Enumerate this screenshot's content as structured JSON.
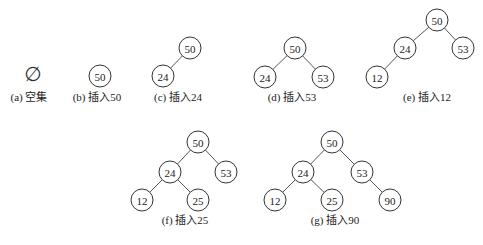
{
  "figure": {
    "node_radius": 11,
    "panels": [
      {
        "id": "a",
        "caption": "(a) 空集",
        "empty_symbol": "∅",
        "symbol_pos": [
          33,
          74
        ],
        "caption_pos": [
          29,
          101
        ],
        "nodes": [],
        "edges": []
      },
      {
        "id": "b",
        "caption": "(b) 插入50",
        "caption_pos": [
          97,
          101
        ],
        "nodes": [
          {
            "label": "50",
            "x": 100,
            "y": 76
          }
        ],
        "edges": []
      },
      {
        "id": "c",
        "caption": "(c) 插入24",
        "caption_pos": [
          178,
          101
        ],
        "nodes": [
          {
            "label": "50",
            "x": 190,
            "y": 48
          },
          {
            "label": "24",
            "x": 163,
            "y": 76
          }
        ],
        "edges": [
          [
            0,
            1
          ]
        ]
      },
      {
        "id": "d",
        "caption": "(d) 插入53",
        "caption_pos": [
          292,
          101
        ],
        "nodes": [
          {
            "label": "50",
            "x": 295,
            "y": 48
          },
          {
            "label": "24",
            "x": 265,
            "y": 77
          },
          {
            "label": "53",
            "x": 323,
            "y": 77
          }
        ],
        "edges": [
          [
            0,
            1
          ],
          [
            0,
            2
          ]
        ]
      },
      {
        "id": "e",
        "caption": "(e) 插入12",
        "caption_pos": [
          427,
          101
        ],
        "nodes": [
          {
            "label": "50",
            "x": 437,
            "y": 20
          },
          {
            "label": "24",
            "x": 405,
            "y": 48
          },
          {
            "label": "53",
            "x": 463,
            "y": 48
          },
          {
            "label": "12",
            "x": 377,
            "y": 77
          }
        ],
        "edges": [
          [
            0,
            1
          ],
          [
            0,
            2
          ],
          [
            1,
            3
          ]
        ]
      },
      {
        "id": "f",
        "caption": "(f) 插入25",
        "caption_pos": [
          185,
          224
        ],
        "nodes": [
          {
            "label": "50",
            "x": 198,
            "y": 142
          },
          {
            "label": "24",
            "x": 170,
            "y": 172
          },
          {
            "label": "53",
            "x": 226,
            "y": 172
          },
          {
            "label": "12",
            "x": 142,
            "y": 200
          },
          {
            "label": "25",
            "x": 198,
            "y": 200
          }
        ],
        "edges": [
          [
            0,
            1
          ],
          [
            0,
            2
          ],
          [
            1,
            3
          ],
          [
            1,
            4
          ]
        ]
      },
      {
        "id": "g",
        "caption": "(g) 插入90",
        "caption_pos": [
          335,
          224
        ],
        "nodes": [
          {
            "label": "50",
            "x": 332,
            "y": 142
          },
          {
            "label": "24",
            "x": 303,
            "y": 172
          },
          {
            "label": "53",
            "x": 362,
            "y": 172
          },
          {
            "label": "12",
            "x": 275,
            "y": 200
          },
          {
            "label": "25",
            "x": 332,
            "y": 200
          },
          {
            "label": "90",
            "x": 390,
            "y": 200
          }
        ],
        "edges": [
          [
            0,
            1
          ],
          [
            0,
            2
          ],
          [
            1,
            3
          ],
          [
            1,
            4
          ],
          [
            2,
            5
          ]
        ]
      }
    ]
  }
}
